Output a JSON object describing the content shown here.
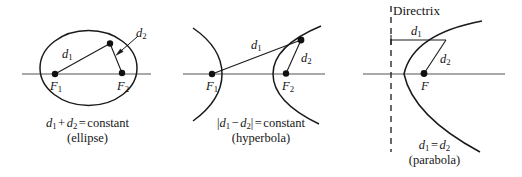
{
  "figure": {
    "background_color": "#ffffff",
    "stroke_color": "#1a1a1a",
    "axis_color": "#555555"
  },
  "panels": [
    {
      "id": "ellipse",
      "name": "ellipse-panel",
      "caption_line1_parts": {
        "d1": "d",
        "d1_sub": "1",
        "plus": "+",
        "d2": "d",
        "d2_sub": "2",
        "equals": "=",
        "value": "constant"
      },
      "caption_line2": "(ellipse)",
      "labels": {
        "focus1": "F",
        "focus1_sub": "1",
        "focus2": "F",
        "focus2_sub": "2",
        "d1": "d",
        "d1_sub": "1",
        "d2": "d",
        "d2_sub": "2"
      }
    },
    {
      "id": "hyperbola",
      "name": "hyperbola-panel",
      "caption_line1_parts": {
        "bar_open": "|",
        "d1": "d",
        "d1_sub": "1",
        "minus": "−",
        "d2": "d",
        "d2_sub": "2",
        "bar_close": "|",
        "equals": "=",
        "value": "constant"
      },
      "caption_line2": "(hyperbola)",
      "labels": {
        "focus1": "F",
        "focus1_sub": "1",
        "focus2": "F",
        "focus2_sub": "2",
        "d1": "d",
        "d1_sub": "1",
        "d2": "d",
        "d2_sub": "2"
      }
    },
    {
      "id": "parabola",
      "name": "parabola-panel",
      "caption_line1_parts": {
        "d1": "d",
        "d1_sub": "1",
        "equals": "=",
        "d2": "d",
        "d2_sub": "2"
      },
      "caption_line2": "(parabola)",
      "labels": {
        "focus": "F",
        "d1": "d",
        "d1_sub": "1",
        "d2": "d",
        "d2_sub": "2",
        "directrix": "Directrix"
      }
    }
  ]
}
